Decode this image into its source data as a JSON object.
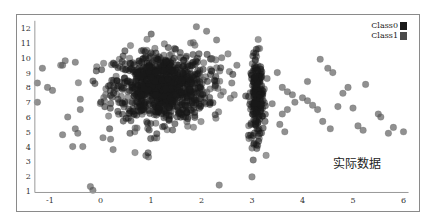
{
  "chart_data": {
    "type": "scatter",
    "title": "",
    "xlabel": "",
    "ylabel": "",
    "xlim": [
      -1.3,
      6.1
    ],
    "ylim": [
      0.9,
      12.5
    ],
    "x_ticks": [
      -1,
      0,
      1,
      2,
      3,
      4,
      5,
      6
    ],
    "y_ticks": [
      1,
      2,
      3,
      4,
      5,
      6,
      7,
      8,
      9,
      10,
      11,
      12
    ],
    "grid": false,
    "legend_position": "top-right",
    "annotation": "实际数据",
    "series": [
      {
        "name": "Class0",
        "color": "#1a1a1a",
        "clusters": [
          {
            "cx": 1.2,
            "cy": 8.0,
            "sx": 0.45,
            "sy": 1.1,
            "n": 700
          },
          {
            "cx": 3.1,
            "cy": 7.2,
            "sx": 0.06,
            "sy": 1.4,
            "n": 160
          }
        ]
      },
      {
        "name": "Class1",
        "color": "#555555",
        "clusters": [
          {
            "cx": 1.3,
            "cy": 8.0,
            "sx": 0.6,
            "sy": 1.3,
            "n": 300
          },
          {
            "cx": 3.1,
            "cy": 7.5,
            "sx": 0.08,
            "sy": 1.6,
            "n": 60
          }
        ],
        "outliers": [
          [
            -1.25,
            7.0
          ],
          [
            -1.25,
            8.3
          ],
          [
            -1.15,
            9.3
          ],
          [
            -1.05,
            8.0
          ],
          [
            -0.95,
            7.8
          ],
          [
            -0.75,
            9.5
          ],
          [
            -0.7,
            9.8
          ],
          [
            -0.65,
            6.0
          ],
          [
            -0.75,
            4.8
          ],
          [
            -0.55,
            4.0
          ],
          [
            -0.5,
            5.2
          ],
          [
            -0.45,
            4.9
          ],
          [
            -0.4,
            7.2
          ],
          [
            -0.4,
            6.5
          ],
          [
            -0.35,
            4.0
          ],
          [
            -0.2,
            1.3
          ],
          [
            -0.15,
            1.05
          ],
          [
            -0.5,
            9.7
          ],
          [
            0.05,
            4.6
          ],
          [
            0.2,
            4.5
          ],
          [
            0.25,
            3.8
          ],
          [
            0.9,
            3.4
          ],
          [
            0.95,
            3.3
          ],
          [
            2.35,
            1.4
          ],
          [
            3.0,
            1.95
          ],
          [
            3.0,
            3.9
          ],
          [
            2.1,
            11.8
          ],
          [
            1.9,
            12.1
          ],
          [
            2.3,
            11.2
          ],
          [
            2.4,
            10.0
          ],
          [
            3.6,
            8.0
          ],
          [
            3.7,
            7.7
          ],
          [
            3.8,
            7.5
          ],
          [
            3.7,
            6.5
          ],
          [
            3.6,
            6.2
          ],
          [
            3.55,
            5.5
          ],
          [
            3.65,
            5.0
          ],
          [
            3.85,
            7.0
          ],
          [
            4.0,
            7.3
          ],
          [
            4.1,
            7.1
          ],
          [
            4.2,
            6.8
          ],
          [
            4.3,
            6.5
          ],
          [
            4.35,
            9.9
          ],
          [
            4.5,
            9.3
          ],
          [
            4.6,
            9.0
          ],
          [
            4.7,
            6.7
          ],
          [
            4.4,
            5.7
          ],
          [
            4.55,
            5.2
          ],
          [
            4.8,
            7.6
          ],
          [
            4.9,
            8.0
          ],
          [
            5.0,
            6.6
          ],
          [
            5.1,
            5.4
          ],
          [
            5.2,
            5.1
          ],
          [
            5.25,
            8.2
          ],
          [
            5.5,
            6.2
          ],
          [
            5.55,
            6.0
          ],
          [
            5.7,
            4.9
          ],
          [
            5.8,
            5.3
          ],
          [
            6.0,
            5.0
          ],
          [
            4.1,
            8.4
          ],
          [
            3.5,
            9.0
          ],
          [
            3.4,
            6.9
          ],
          [
            3.3,
            8.6
          ],
          [
            2.7,
            9.5
          ],
          [
            2.6,
            8.3
          ]
        ]
      }
    ]
  },
  "legend": {
    "items": [
      {
        "label": "Class0",
        "color": "#1a1a1a"
      },
      {
        "label": "Class1",
        "color": "#4a4a4a"
      }
    ]
  }
}
